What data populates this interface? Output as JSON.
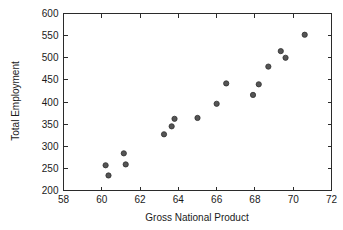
{
  "chart_data": {
    "type": "scatter",
    "title": "",
    "xlabel": "Gross National Product",
    "ylabel": "Total Employment",
    "xlim": [
      58,
      72
    ],
    "ylim": [
      200,
      600
    ],
    "xticks": [
      58,
      60,
      62,
      64,
      66,
      68,
      70,
      72
    ],
    "yticks": [
      200,
      250,
      300,
      350,
      400,
      450,
      500,
      550,
      600
    ],
    "grid": false,
    "legend": null,
    "marker": {
      "shape": "circle",
      "color": "#555555",
      "edge_color": "#2f2f2f",
      "size": 4.2
    },
    "points": [
      {
        "x": 60.2,
        "y": 257
      },
      {
        "x": 60.35,
        "y": 234
      },
      {
        "x": 61.15,
        "y": 284
      },
      {
        "x": 61.25,
        "y": 259
      },
      {
        "x": 63.25,
        "y": 327
      },
      {
        "x": 63.65,
        "y": 345
      },
      {
        "x": 63.8,
        "y": 362
      },
      {
        "x": 65.0,
        "y": 364
      },
      {
        "x": 66.0,
        "y": 396
      },
      {
        "x": 66.5,
        "y": 442
      },
      {
        "x": 67.9,
        "y": 416
      },
      {
        "x": 68.2,
        "y": 440
      },
      {
        "x": 68.7,
        "y": 480
      },
      {
        "x": 69.35,
        "y": 515
      },
      {
        "x": 69.6,
        "y": 500
      },
      {
        "x": 70.6,
        "y": 552
      }
    ]
  },
  "axes": {
    "x_tick_labels": [
      "58",
      "60",
      "62",
      "64",
      "66",
      "68",
      "70",
      "72"
    ],
    "y_tick_labels": [
      "200",
      "250",
      "300",
      "350",
      "400",
      "450",
      "500",
      "550",
      "600"
    ],
    "x_axis_title": "Gross National Product",
    "y_axis_title": "Total Employment"
  }
}
